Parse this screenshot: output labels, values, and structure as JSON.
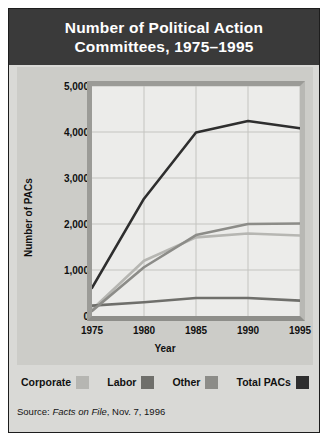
{
  "title": {
    "line1": "Number of Political Action",
    "line2": "Committees, 1975–1995"
  },
  "source": {
    "prefix": "Source: ",
    "publication": "Facts on File",
    "suffix": ", Nov. 7, 1996"
  },
  "legend": [
    {
      "label": "Corporate",
      "color": "#b6b6b2"
    },
    {
      "label": "Labor",
      "color": "#6f6f6b"
    },
    {
      "label": "Other",
      "color": "#8c8c88"
    },
    {
      "label": "Total PACs",
      "color": "#2e2e2e"
    }
  ],
  "colors": {
    "banner": "#3a3a3a",
    "figure_background": "#d9d9d6",
    "panel": "#ccccc8",
    "plot_background": "#ececea",
    "gridline": "#c4c4c0"
  },
  "chart_data": {
    "type": "line",
    "title": "Number of Political Action Committees, 1975–1995",
    "xlabel": "Year",
    "ylabel": "Number of PACs",
    "x": [
      1975,
      1980,
      1985,
      1990,
      1995
    ],
    "xtick_labels": [
      "1975",
      "1980",
      "1985",
      "1990",
      "1995"
    ],
    "ytick_labels": [
      "0",
      "1,000",
      "2,000",
      "3,000",
      "4,000",
      "5,000"
    ],
    "yticks": [
      0,
      1000,
      2000,
      3000,
      4000,
      5000
    ],
    "xlim": [
      1975,
      1995
    ],
    "ylim": [
      0,
      5000
    ],
    "grid": true,
    "legend_position": "below",
    "series": [
      {
        "name": "Corporate",
        "color": "#b6b6b2",
        "values": [
          140,
          1200,
          1710,
          1795,
          1750
        ]
      },
      {
        "name": "Labor",
        "color": "#6f6f6b",
        "values": [
          225,
          300,
          390,
          390,
          335
        ]
      },
      {
        "name": "Other",
        "color": "#8c8c88",
        "values": [
          110,
          1060,
          1760,
          2000,
          2010
        ]
      },
      {
        "name": "Total PACs",
        "color": "#2e2e2e",
        "values": [
          610,
          2550,
          3990,
          4240,
          4080
        ]
      }
    ]
  }
}
